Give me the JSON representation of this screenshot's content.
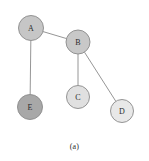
{
  "figure": {
    "caption": "(a)",
    "caption_y": 142,
    "background": "#ffffff",
    "width": 149,
    "height": 161
  },
  "graph": {
    "node_stroke": "#8a8a8a",
    "edge_color": "#8a8a8a",
    "label_color": "#2b2b2b",
    "nodes": [
      {
        "id": "A",
        "label": "A",
        "cx": 31,
        "cy": 28,
        "r": 12.5,
        "fill": "#c6c6c6"
      },
      {
        "id": "B",
        "label": "B",
        "cx": 78,
        "cy": 42,
        "r": 12.0,
        "fill": "#c8c8c8"
      },
      {
        "id": "C",
        "label": "C",
        "cx": 78,
        "cy": 97,
        "r": 11.5,
        "fill": "#e0e0e0"
      },
      {
        "id": "D",
        "label": "D",
        "cx": 122,
        "cy": 111,
        "r": 11.5,
        "fill": "#e8e8e8"
      },
      {
        "id": "E",
        "label": "E",
        "cx": 30,
        "cy": 107,
        "r": 12.5,
        "fill": "#a8a8a8"
      }
    ],
    "edges": [
      {
        "source": "A",
        "target": "B"
      },
      {
        "source": "A",
        "target": "E"
      },
      {
        "source": "B",
        "target": "C"
      },
      {
        "source": "B",
        "target": "D"
      }
    ]
  }
}
